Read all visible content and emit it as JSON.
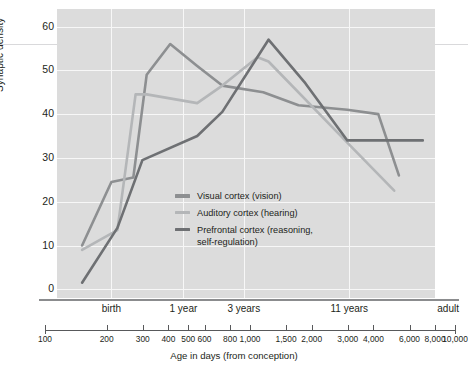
{
  "chart_data": {
    "type": "line",
    "title": "",
    "xlabel": "Age in days (from conception)",
    "ylabel": "Synaptic density",
    "xscale": "log",
    "xlim": [
      100,
      10000
    ],
    "ylim": [
      -2,
      64
    ],
    "grid": true,
    "legend_position": "inside-center",
    "y_ticks": [
      0,
      10,
      20,
      30,
      40,
      50,
      60
    ],
    "x_ticks": [
      100,
      200,
      300,
      400,
      500,
      600,
      800,
      1000,
      1500,
      2000,
      3000,
      4000,
      6000,
      8000,
      10000
    ],
    "x_tick_labels": [
      "100",
      "200",
      "300",
      "400",
      "500",
      "600",
      "800",
      "1,000",
      "1,500",
      "2,000",
      "3,000",
      "4,000",
      "6,000",
      "8,000",
      "10,000"
    ],
    "era_labels": [
      {
        "label": "birth",
        "x": 280
      },
      {
        "label": "1 year",
        "x": 640
      },
      {
        "label": "3 years",
        "x": 1280
      },
      {
        "label": "11 years",
        "x": 4300
      },
      {
        "label": "adult",
        "x": 10000
      }
    ],
    "vertical_gridlines": [
      280,
      640,
      1280,
      4300
    ],
    "series": [
      {
        "name": "Visual cortex (vision)",
        "color": "#8d8f91",
        "x": [
          200,
          280,
          360,
          420,
          550,
          750,
          1000,
          1600,
          2400,
          4200,
          6000,
          7600
        ],
        "values": [
          10,
          24.5,
          25.5,
          49,
          56,
          51,
          46.5,
          45,
          42,
          41,
          40,
          26
        ]
      },
      {
        "name": "Auditory cortex (hearing)",
        "color": "#b4b6b8",
        "x": [
          200,
          300,
          370,
          420,
          750,
          1000,
          1500,
          1700,
          4200,
          7200
        ],
        "values": [
          9,
          13.5,
          44.5,
          44.5,
          42.5,
          46.5,
          53,
          52,
          33.5,
          22.5
        ]
      },
      {
        "name": "Prefrontal cortex (reasoning,\nself-regulation)",
        "color": "#6e7073",
        "x": [
          200,
          300,
          400,
          750,
          1000,
          1700,
          2600,
          4200,
          10000
        ],
        "values": [
          1.5,
          14,
          29.5,
          35,
          40.5,
          57,
          47,
          34,
          34
        ]
      }
    ]
  },
  "axis": {
    "y_title": "Synaptic density",
    "x_title": "Age in days (from conception)"
  },
  "legend": {
    "items": [
      {
        "label": "Visual cortex (vision)",
        "color": "#8d8f91"
      },
      {
        "label": "Auditory cortex (hearing)",
        "color": "#b4b6b8"
      },
      {
        "label": "Prefrontal cortex (reasoning,\nself-regulation)",
        "color": "#6e7073"
      }
    ]
  }
}
